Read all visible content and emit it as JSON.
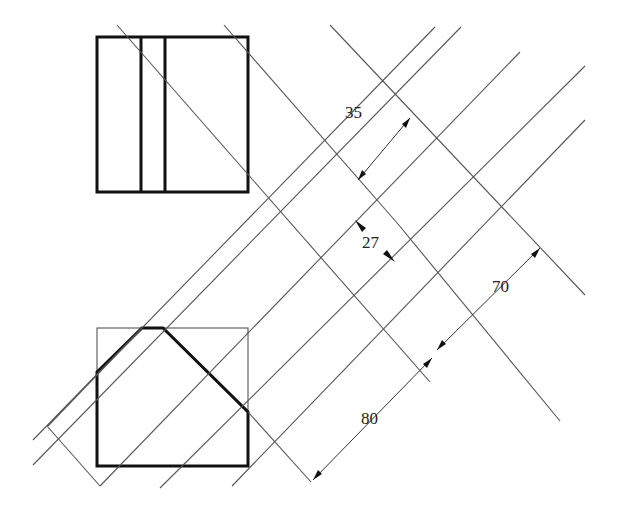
{
  "diagram": {
    "type": "orthographic projection / auxiliary view construction",
    "views": {
      "top_view": {
        "description": "rectangle with two vertical inner lines (slot)"
      },
      "front_view": {
        "description": "pentagon (rectangle with chamfered top corners) inside a thin bounding box"
      }
    },
    "dimensions": [
      {
        "id": "dim-35",
        "label": "35",
        "x": 345,
        "y": 104
      },
      {
        "id": "dim-27",
        "label": "27",
        "x": 362,
        "y": 234
      },
      {
        "id": "dim-70",
        "label": "70",
        "x": 492,
        "y": 278
      },
      {
        "id": "dim-80",
        "label": "80",
        "x": 361,
        "y": 410
      }
    ]
  }
}
